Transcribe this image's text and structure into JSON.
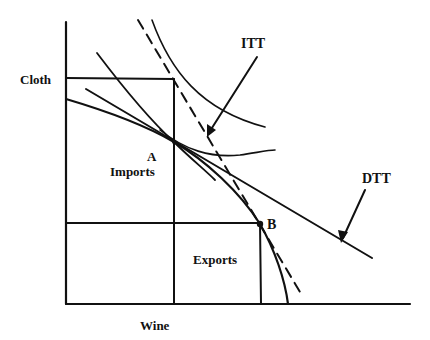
{
  "diagram": {
    "type": "trade-theory production possibility diagram",
    "axes": {
      "y_label": "Cloth",
      "x_label": "Wine"
    },
    "points": [
      {
        "id": "A",
        "label": "A"
      },
      {
        "id": "B",
        "label": "B"
      }
    ],
    "regions": {
      "imports_label": "Imports",
      "exports_label": "Exports"
    },
    "lines": {
      "itt_label": "ITT",
      "dtt_label": "DTT"
    },
    "colors": {
      "ink": "#111111",
      "background": "#ffffff"
    }
  }
}
